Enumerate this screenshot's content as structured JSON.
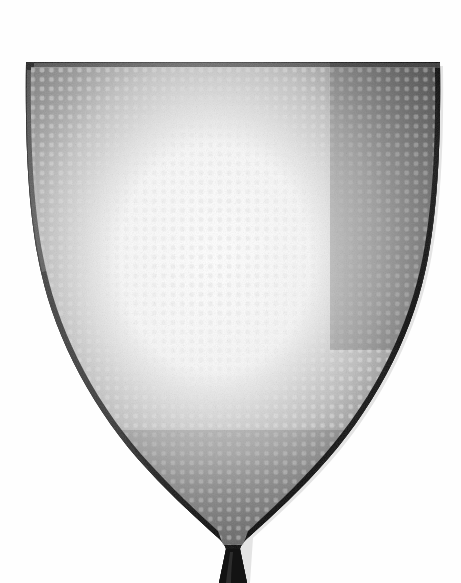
{
  "image": {
    "subject": "fly-swatter",
    "description": "Black perforated plastic fly swatter head, shield shape, tapering to a narrow handle stem at the bottom, photographed against a plain white background",
    "orientation": "vertical",
    "width": 461,
    "height": 583
  },
  "background": {
    "color": "#fefefe"
  },
  "swatter": {
    "body_color": "#1c1c1c",
    "body_color_light": "#6a6a6a",
    "body_color_mid": "#3a3a3a",
    "body_color_dark": "#101010",
    "edge_color": "#0b0b0b",
    "rim_highlight": "#8a8a8a",
    "hole_color": "#f2f2f2",
    "hole_shape": "rounded-square",
    "hole_pitch_x": 9.35,
    "hole_pitch_y": 9.35,
    "hole_size": 4.6,
    "hole_corner_radius": 1.3,
    "geometry": {
      "top_y": 61,
      "top_left_x": 34,
      "top_right_x": 440,
      "top_sag": 4,
      "shoulder_y": 250,
      "shoulder_left_x": 40,
      "shoulder_right_x": 432,
      "taper_start_y": 300,
      "tip_y": 548,
      "stem_left_x": 219,
      "stem_right_x": 247,
      "stem_bottom_y": 583,
      "center_x": 233
    },
    "shading": {
      "highlight_center_x": 0.47,
      "highlight_center_y": 0.42,
      "highlight_radius": 0.62,
      "vignette_strength": 0.55
    }
  }
}
